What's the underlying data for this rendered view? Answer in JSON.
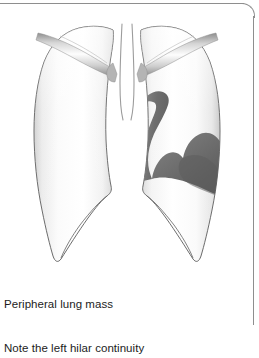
{
  "figure": {
    "name": "chest-radiograph-line-drawing",
    "modality_depicted": "frontal chest radiograph schematic"
  },
  "caption": {
    "line1": "Peripheral lung mass",
    "line2": "Note the left hilar continuity"
  },
  "colors": {
    "outline": "#555555",
    "lung_fill_light": "#ffffff",
    "lung_fill_shade": "#e4e4e4",
    "lung_edge_shade": "#c9c9c9",
    "mass_dark": "#5f5f5f",
    "mass_mid": "#6e6e6e",
    "mass_light": "#8c8c8c",
    "bone_light": "#fdfdfd",
    "bone_shade": "#9a9a9a",
    "frame_border": "#8e8e8e",
    "text": "#1c1c1c",
    "background": "#ffffff"
  },
  "structures": [
    {
      "id": "right-lung-field",
      "label": "right lung field",
      "side": "image-left"
    },
    {
      "id": "left-lung-field",
      "label": "left lung field",
      "side": "image-right"
    },
    {
      "id": "trachea",
      "label": "trachea"
    },
    {
      "id": "right-clavicle",
      "label": "right clavicle"
    },
    {
      "id": "left-clavicle",
      "label": "left clavicle"
    },
    {
      "id": "lung-mass",
      "label": "peripheral lung mass"
    },
    {
      "id": "hilar-continuity-band",
      "label": "left hilar continuity band"
    },
    {
      "id": "right-costophrenic-angle",
      "label": "right costophrenic angle"
    },
    {
      "id": "left-costophrenic-angle",
      "label": "left costophrenic angle"
    }
  ]
}
